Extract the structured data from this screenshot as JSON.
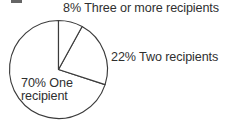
{
  "figure": {
    "background_color": "#ffffff",
    "width": 235,
    "height": 131,
    "clipped_glyph_fragment": ""
  },
  "chart_data": {
    "type": "pie",
    "title": "",
    "subtitle": "",
    "xlabel": "",
    "ylabel": "",
    "grid": false,
    "legend_position": "none",
    "label_style": "outside-and-inside callouts",
    "fill": "none",
    "stroke_color": "#3b3b3b",
    "text_color": "#2f2f2f",
    "start_angle_deg": 0,
    "direction": "clockwise",
    "units": "percent",
    "total": 100,
    "categories": [
      "Three or more recipients",
      "Two recipients",
      "One recipient"
    ],
    "values": [
      8,
      22,
      70
    ],
    "slices": [
      {
        "label": "Three or more recipients",
        "value": 8,
        "percent_text": "8%",
        "full_label": "8% Three or more recipients",
        "start_angle_deg": 0,
        "end_angle_deg": 28.8,
        "label_placement": "outside-top-right"
      },
      {
        "label": "Two recipients",
        "value": 22,
        "percent_text": "22%",
        "full_label": "22% Two recipients",
        "start_angle_deg": 28.8,
        "end_angle_deg": 108,
        "label_placement": "outside-right"
      },
      {
        "label": "One recipient",
        "value": 70,
        "percent_text": "70%",
        "full_label": "70% One\nrecipient",
        "start_angle_deg": 108,
        "end_angle_deg": 360,
        "label_placement": "inside-left"
      }
    ]
  },
  "labels": {
    "three_or_more": "8% Three or more recipients",
    "two": "22% Two recipients",
    "one": "70% One\nrecipient"
  },
  "geometry": {
    "center_x": 58.5,
    "center_y": 69.5,
    "radius": 49
  }
}
